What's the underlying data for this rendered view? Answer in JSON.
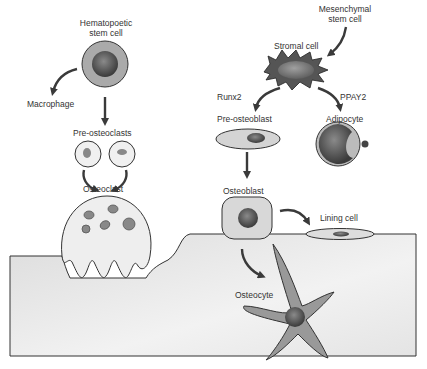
{
  "diagram": {
    "colors": {
      "outline": "#333333",
      "cell_fill": "#d8d8d8",
      "bone_fill": "#e6e6e6",
      "nucleus_fill": "#5a5a5a",
      "arrow": "#3a3a3a"
    },
    "labels": {
      "hsc": "Hematopoetic\nstem cell",
      "macrophage": "Macrophage",
      "pre_osteoclasts": "Pre-osteoclasts",
      "osteoclast": "Osteoclast",
      "msc": "Mesenchymal\nstem cell",
      "stromal": "Stromal cell",
      "runx2": "Runx2",
      "ppay2": "PPAY2",
      "pre_osteoblast": "Pre-osteoblast",
      "adipocyte": "Adipocyte",
      "osteoblast": "Osteoblast",
      "lining": "Lining cell",
      "osteocyte": "Osteocyte"
    },
    "nodes": [
      {
        "id": "hsc",
        "label": "Hematopoetic stem cell"
      },
      {
        "id": "macrophage",
        "label": "Macrophage"
      },
      {
        "id": "pre_osteoclasts",
        "label": "Pre-osteoclasts"
      },
      {
        "id": "osteoclast",
        "label": "Osteoclast"
      },
      {
        "id": "msc",
        "label": "Mesenchymal stem cell"
      },
      {
        "id": "stromal",
        "label": "Stromal cell"
      },
      {
        "id": "pre_osteoblast",
        "label": "Pre-osteoblast"
      },
      {
        "id": "adipocyte",
        "label": "Adipocyte"
      },
      {
        "id": "osteoblast",
        "label": "Osteoblast"
      },
      {
        "id": "lining",
        "label": "Lining cell"
      },
      {
        "id": "osteocyte",
        "label": "Osteocyte"
      }
    ],
    "edges": [
      {
        "from": "hsc",
        "to": "macrophage"
      },
      {
        "from": "hsc",
        "to": "pre_osteoclasts"
      },
      {
        "from": "pre_osteoclasts",
        "to": "osteoclast"
      },
      {
        "from": "msc",
        "to": "stromal"
      },
      {
        "from": "stromal",
        "to": "pre_osteoblast",
        "label": "Runx2"
      },
      {
        "from": "stromal",
        "to": "adipocyte",
        "label": "PPAY2"
      },
      {
        "from": "pre_osteoblast",
        "to": "osteoblast"
      },
      {
        "from": "osteoblast",
        "to": "lining"
      },
      {
        "from": "osteoblast",
        "to": "osteocyte"
      }
    ]
  }
}
